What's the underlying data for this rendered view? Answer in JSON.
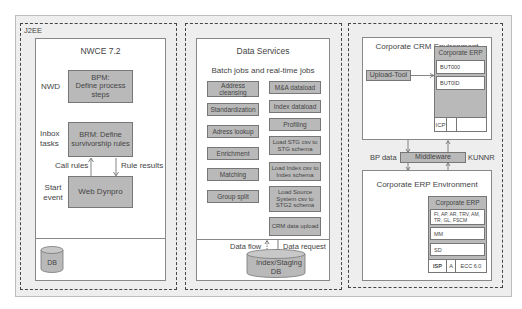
{
  "j2ee": {
    "label": "J2EE",
    "nwce": {
      "title": "NWCE 7.2",
      "rows": [
        {
          "side_label": "NWD",
          "box": "BPM:\nDefine process steps"
        },
        {
          "side_label": "Inbox tasks",
          "box": "BRM: Define survivorship rules"
        },
        {
          "side_label": "Start event",
          "box": "Web Dynpro"
        }
      ],
      "call_rules": "Call rules",
      "rule_results": "Rule results",
      "db": "DB"
    }
  },
  "data_services": {
    "title": "Data Services",
    "subtitle": "Batch jobs and real-time jobs",
    "left_jobs": [
      "Address cleansing",
      "Standardization",
      "Adress lookup",
      "Enrichment",
      "Matching",
      "Group split"
    ],
    "right_jobs": [
      "M&A dataload",
      "Index dataload",
      "Profiling",
      "Load STG csv to STG schema",
      "Load Index csv to Index schema",
      "Load Source System csv to STG2 schema",
      "CRM data upload"
    ],
    "data_flow": "Data flow",
    "data_request": "Data request",
    "db": "Index/Staging DB"
  },
  "crm_env": {
    "title": "Corporate CRM Environment",
    "upload_tool": "Upload-Tool",
    "erp_title": "Corporate ERP",
    "rows": [
      "BUT000",
      "BUT0ID"
    ],
    "bottom": [
      "ICP",
      "",
      ""
    ]
  },
  "middleware": {
    "label": "Middleware",
    "left": "BP data",
    "right": "KUNNR"
  },
  "erp_env": {
    "title": "Corporate ERP Environment",
    "erp_title": "Corporate ERP",
    "rows": [
      "FI, AP, AR, TRV, AM, TR, GL, FSCM",
      "MM",
      "SD"
    ],
    "bottom": [
      "ISP",
      "A",
      "ECC 6.0"
    ]
  },
  "colors": {
    "background": "#eeeeee",
    "box_fill": "#b9b9b9",
    "border": "#777777"
  }
}
